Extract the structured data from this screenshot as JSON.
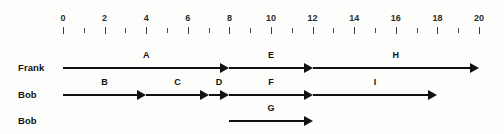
{
  "diagram": {
    "background_color": "#fdfdfc",
    "line_color": "#111111",
    "axis": {
      "name": "time-axis",
      "min": 0,
      "max": 20,
      "tick_interval": 1,
      "label_interval": 2,
      "labels": [
        "0",
        "2",
        "4",
        "6",
        "8",
        "10",
        "12",
        "14",
        "16",
        "18",
        "20"
      ],
      "label_values": [
        0,
        2,
        4,
        6,
        8,
        10,
        12,
        14,
        16,
        18,
        20
      ],
      "tick_values": [
        0,
        1,
        2,
        3,
        4,
        5,
        6,
        7,
        8,
        9,
        10,
        11,
        12,
        13,
        14,
        15,
        16,
        17,
        18,
        19,
        20
      ]
    },
    "rows": [
      {
        "label": "Frank",
        "segments": [
          {
            "label": "A",
            "start": 0,
            "end": 8
          },
          {
            "label": "E",
            "start": 8,
            "end": 12
          },
          {
            "label": "H",
            "start": 12,
            "end": 20
          }
        ]
      },
      {
        "label": "Bob",
        "segments": [
          {
            "label": "B",
            "start": 0,
            "end": 4
          },
          {
            "label": "C",
            "start": 4,
            "end": 7
          },
          {
            "label": "D",
            "start": 7,
            "end": 8
          },
          {
            "label": "F",
            "start": 8,
            "end": 12
          },
          {
            "label": "I",
            "start": 12,
            "end": 18
          }
        ]
      },
      {
        "label": "Bob",
        "segments": [
          {
            "label": "G",
            "start": 8,
            "end": 12
          }
        ]
      }
    ]
  },
  "chart_data": {
    "type": "bar",
    "xlabel": "",
    "ylabel": "",
    "xlim": [
      0,
      20
    ],
    "grid": false,
    "categories": [
      "Frank",
      "Bob",
      "Bob"
    ],
    "series": [
      {
        "name": "A",
        "row": "Frank",
        "start": 0,
        "end": 8,
        "duration": 8
      },
      {
        "name": "E",
        "row": "Frank",
        "start": 8,
        "end": 12,
        "duration": 4
      },
      {
        "name": "H",
        "row": "Frank",
        "start": 12,
        "end": 20,
        "duration": 8
      },
      {
        "name": "B",
        "row": "Bob",
        "start": 0,
        "end": 4,
        "duration": 4
      },
      {
        "name": "C",
        "row": "Bob",
        "start": 4,
        "end": 7,
        "duration": 3
      },
      {
        "name": "D",
        "row": "Bob",
        "start": 7,
        "end": 8,
        "duration": 1
      },
      {
        "name": "F",
        "row": "Bob",
        "start": 8,
        "end": 12,
        "duration": 4
      },
      {
        "name": "I",
        "row": "Bob",
        "start": 12,
        "end": 18,
        "duration": 6
      },
      {
        "name": "G",
        "row": "Bob",
        "start": 8,
        "end": 12,
        "duration": 4
      }
    ]
  }
}
